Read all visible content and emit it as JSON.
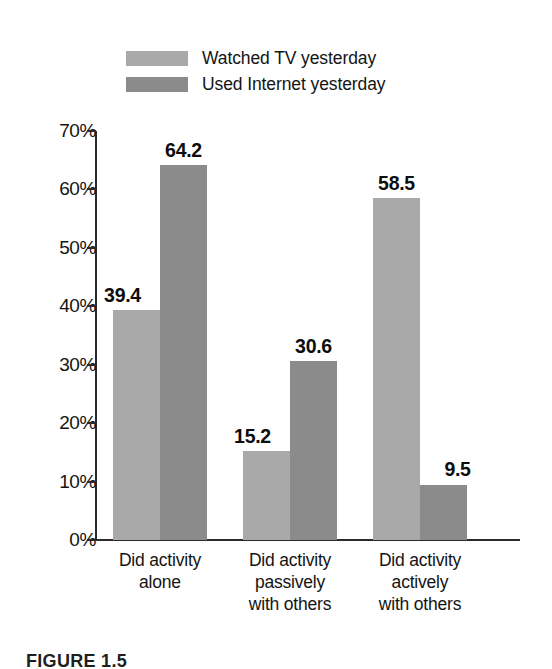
{
  "chart_data": {
    "type": "bar",
    "title": "",
    "xlabel": "",
    "ylabel": "",
    "ylim": [
      0,
      70
    ],
    "grid": false,
    "legend_position": "top-center",
    "categories": [
      "Did activity alone",
      "Did activity passively with others",
      "Did activity actively with others"
    ],
    "category_lines": [
      [
        "Did activity",
        "alone"
      ],
      [
        "Did activity",
        "passively",
        "with others"
      ],
      [
        "Did activity",
        "actively",
        "with others"
      ]
    ],
    "series": [
      {
        "name": "Watched TV yesterday",
        "color": "#a9a9a9",
        "values": [
          39.4,
          15.2,
          58.5
        ],
        "value_labels": [
          "39.4",
          "15.2",
          "58.5"
        ]
      },
      {
        "name": "Used Internet yesterday",
        "color": "#8b8b8b",
        "values": [
          64.2,
          30.6,
          9.5
        ],
        "value_labels": [
          "64.2",
          "30.6",
          "9.5"
        ]
      }
    ],
    "y_ticks": [
      {
        "value": 70,
        "label": "70%"
      },
      {
        "value": 60,
        "label": "60%"
      },
      {
        "value": 50,
        "label": "50%"
      },
      {
        "value": 40,
        "label": "40%"
      },
      {
        "value": 30,
        "label": "30%"
      },
      {
        "value": 20,
        "label": "20%"
      },
      {
        "value": 10,
        "label": "10%"
      },
      {
        "value": 0,
        "label": "0%"
      }
    ]
  },
  "legend": {
    "items": [
      {
        "label": "Watched TV yesterday",
        "color": "#a9a9a9"
      },
      {
        "label": "Used Internet yesterday",
        "color": "#8b8b8b"
      }
    ]
  },
  "caption": {
    "text": "FIGURE 1.5"
  }
}
